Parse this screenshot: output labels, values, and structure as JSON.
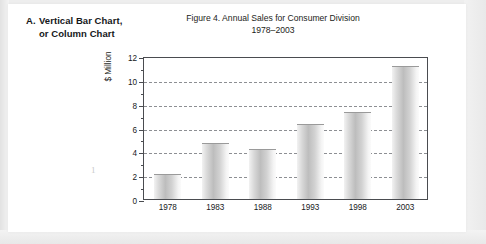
{
  "section": {
    "letter": "A.",
    "line1": "Vertical Bar Chart,",
    "line2": "or Column Chart"
  },
  "page_number": "1",
  "chart_data": {
    "type": "bar",
    "title": "Figure 4.  Annual Sales for Consumer Division",
    "subtitle": "1978–2003",
    "categories": [
      "1978",
      "1983",
      "1988",
      "1993",
      "1998",
      "2003"
    ],
    "values": [
      2.0,
      4.6,
      4.1,
      6.2,
      7.2,
      11.1
    ],
    "xlabel": "",
    "ylabel": "$ Million",
    "ylim": [
      0,
      12
    ],
    "ytick_labels": [
      "0",
      "2",
      "4",
      "6",
      "8",
      "10",
      "12"
    ],
    "ytick_values": [
      0,
      2,
      4,
      6,
      8,
      10,
      12
    ],
    "yminor_values": [
      1,
      3,
      5,
      7,
      9,
      11
    ],
    "grid": "horizontal-dashed",
    "legend": "none",
    "bar_fill": "#cfcfcf",
    "frame_color": "#4a4c50",
    "grid_color": "#8d8f93"
  }
}
